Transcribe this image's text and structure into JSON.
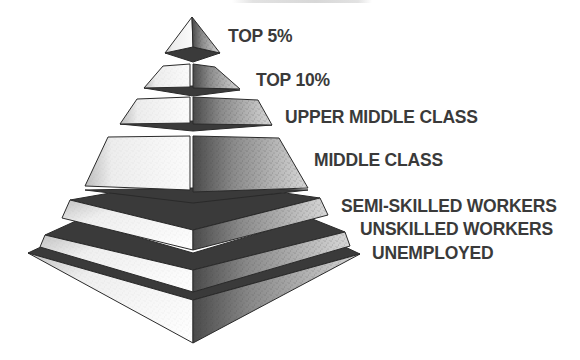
{
  "figure": {
    "type": "social class pyramid",
    "title_cropped": true,
    "colors": {
      "dark_face": "#3a3a3a",
      "light_face": "#f2f2f2",
      "text": "#3a3a3a",
      "outline": "#2a2a2a"
    },
    "layers": [
      {
        "id": "top-5",
        "label": "TOP 5%"
      },
      {
        "id": "top-10",
        "label": "TOP 10%"
      },
      {
        "id": "upper-middle",
        "label": "UPPER MIDDLE CLASS"
      },
      {
        "id": "middle",
        "label": "MIDDLE CLASS"
      },
      {
        "id": "semi-skilled",
        "label": "SEMI-SKILLED WORKERS"
      },
      {
        "id": "unskilled",
        "label": "UNSKILLED WORKERS"
      },
      {
        "id": "unemployed",
        "label": "UNEMPLOYED"
      }
    ]
  }
}
